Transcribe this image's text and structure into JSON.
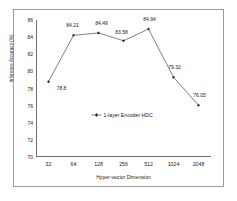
{
  "chart_data": {
    "type": "line",
    "title": "",
    "xlabel": "Hyper-vector Dimension",
    "ylabel": "Inference Accuracy (%)",
    "categories": [
      "32",
      "64",
      "128",
      "256",
      "512",
      "1024",
      "2048"
    ],
    "values": [
      78.8,
      84.21,
      84.49,
      83.58,
      84.94,
      79.32,
      76.05
    ],
    "point_labels": [
      "78.8",
      "84.21",
      "84.49",
      "83.58",
      "84.94",
      "79.32",
      "76.05"
    ],
    "series": [
      {
        "name": "1-layer Encoder HDC",
        "values": [
          78.8,
          84.21,
          84.49,
          83.58,
          84.94,
          79.32,
          76.05
        ]
      }
    ],
    "yticks": [
      86,
      84,
      82,
      80,
      78,
      76,
      74,
      72,
      70
    ],
    "ytick_labels": [
      "86",
      "84",
      "82",
      "80",
      "78",
      "76",
      "74",
      "72",
      "70"
    ],
    "ylim": [
      70,
      86
    ],
    "grid": false,
    "legend_position": "inside-center",
    "line_color": "#2b2b2b",
    "marker_color": "#2b2b2b",
    "marker": "diamond",
    "axis_color": "#6e6e6e",
    "frame_color": "#9a9a9a",
    "background": "#ffffff"
  },
  "legend": {
    "entries": [
      {
        "label": "1-layer Encoder HDC",
        "color": "#2b2b2b"
      }
    ]
  }
}
